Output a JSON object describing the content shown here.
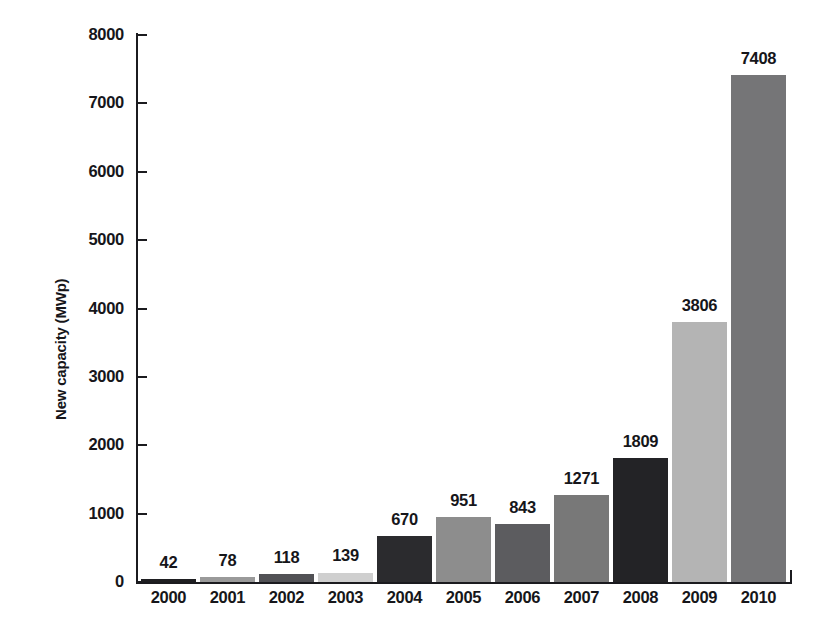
{
  "chart_data": {
    "type": "bar",
    "title": "",
    "xlabel": "",
    "ylabel": "New capacity (MWp)",
    "ylim": [
      0,
      8000
    ],
    "ytick_step": 1000,
    "yticks": [
      "0",
      "1000",
      "2000",
      "3000",
      "4000",
      "5000",
      "6000",
      "7000",
      "8000"
    ],
    "grid": false,
    "legend": null,
    "categories": [
      "2000",
      "2001",
      "2002",
      "2003",
      "2004",
      "2005",
      "2006",
      "2007",
      "2008",
      "2009",
      "2010"
    ],
    "values": [
      42,
      78,
      118,
      139,
      670,
      951,
      843,
      1271,
      1809,
      3806,
      7408
    ],
    "value_labels": [
      "42",
      "78",
      "118",
      "139",
      "670",
      "951",
      "843",
      "1271",
      "1809",
      "3806",
      "7408"
    ],
    "bar_colors": [
      "#1f1f22",
      "#9a9a9a",
      "#515155",
      "#cfcfcf",
      "#2b2b2e",
      "#8d8d8d",
      "#5c5c5f",
      "#787878",
      "#232326",
      "#b4b4b4",
      "#757577"
    ]
  },
  "axis": {
    "y_label_text": "New capacity (MWp)"
  }
}
